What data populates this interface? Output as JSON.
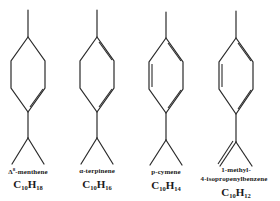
{
  "figure": {
    "type": "chemical-structure-comparison",
    "line_color": "#2a2a2a",
    "background": "#ffffff"
  },
  "compounds": [
    {
      "name_prefix": "Δ",
      "name_sup": "8",
      "name": "-menthene",
      "name_line2": "",
      "formula_c": "C",
      "formula_c_sub": "10",
      "formula_h": "H",
      "formula_h_sub": "18",
      "ring_double_bonds": [
        "lower-right"
      ],
      "side_chain": "isopropyl"
    },
    {
      "name_prefix": "",
      "name_sup": "",
      "name": "α-terpinene",
      "name_line2": "",
      "formula_c": "C",
      "formula_c_sub": "10",
      "formula_h": "H",
      "formula_h_sub": "16",
      "ring_double_bonds": [
        "upper-right",
        "lower-right"
      ],
      "side_chain": "isopropyl"
    },
    {
      "name_prefix": "",
      "name_sup": "",
      "name": "p-cymene",
      "name_line2": "",
      "formula_c": "C",
      "formula_c_sub": "10",
      "formula_h": "H",
      "formula_h_sub": "14",
      "ring_double_bonds": [
        "upper-right",
        "left",
        "lower-right"
      ],
      "side_chain": "isopropyl"
    },
    {
      "name_prefix": "",
      "name_sup": "",
      "name": "1-methyl-",
      "name_line2": "4-isopropenylbenzene",
      "formula_c": "C",
      "formula_c_sub": "10",
      "formula_h": "H",
      "formula_h_sub": "12",
      "ring_double_bonds": [
        "upper-right",
        "left",
        "lower-right"
      ],
      "side_chain": "isopropenyl"
    }
  ]
}
